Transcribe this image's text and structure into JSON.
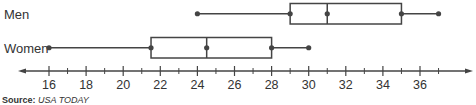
{
  "chart_data": {
    "type": "boxplot",
    "title": "",
    "xlabel": "",
    "ylabel": "",
    "xlim": [
      14.5,
      38.5
    ],
    "ticks": [
      16,
      18,
      20,
      22,
      24,
      26,
      28,
      30,
      32,
      34,
      36
    ],
    "tick_labels": [
      "16",
      "18",
      "20",
      "22",
      "24",
      "26",
      "28",
      "30",
      "32",
      "34",
      "36"
    ],
    "minor_ticks": [
      17,
      19,
      21,
      23,
      25,
      27,
      29,
      31,
      33,
      35,
      37
    ],
    "grid": false,
    "series": [
      {
        "name": "Men",
        "min": 24,
        "q1": 29,
        "median": 31,
        "q3": 35,
        "max": 37
      },
      {
        "name": "Women",
        "min": 16,
        "q1": 21.5,
        "median": 24.5,
        "q3": 28,
        "max": 30
      }
    ]
  },
  "labels": {
    "men": "Men",
    "women": "Women"
  },
  "source": {
    "prefix": "Source:",
    "name": "USA TODAY"
  },
  "colors": {
    "line": "#444444",
    "text": "#333333"
  }
}
